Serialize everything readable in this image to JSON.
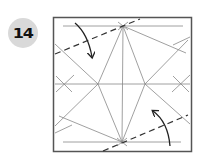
{
  "step": {
    "number": "14"
  },
  "diagram": {
    "paper_color": "#ffffff",
    "border_color": "#555555",
    "crease_color": "#777777",
    "arrow_color": "#222222",
    "dashed_color": "#333333",
    "elements": [
      "square-paper",
      "crease-pattern",
      "valley-fold-line-top-left",
      "valley-fold-line-bottom-right",
      "fold-arrow-top-left",
      "fold-arrow-bottom-right"
    ]
  }
}
